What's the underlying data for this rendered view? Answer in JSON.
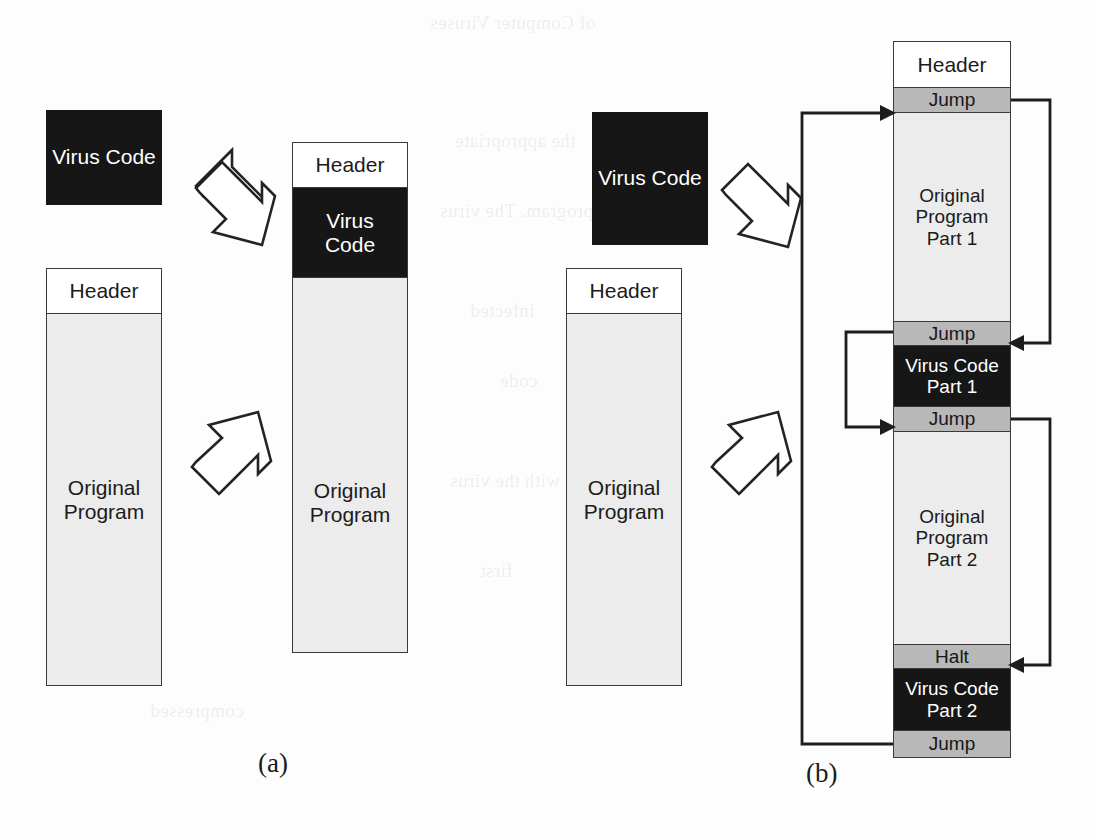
{
  "figure": {
    "captions": {
      "left": "(a)",
      "right": "(b)"
    }
  },
  "panel_a": {
    "name": "simple-prepend-infection",
    "virus_chip": {
      "line1": "Virus",
      "line2": "Code"
    },
    "original": {
      "header": "Header",
      "body_line1": "Original",
      "body_line2": "Program"
    },
    "infected": {
      "header": "Header",
      "virus_line1": "Virus",
      "virus_line2": "Code",
      "body_line1": "Original",
      "body_line2": "Program"
    },
    "arrows": [
      {
        "name": "virus-insert-arrow",
        "direction": "down-right"
      },
      {
        "name": "program-insert-arrow",
        "direction": "up-right"
      }
    ]
  },
  "panel_b": {
    "name": "split-jump-infection",
    "virus_chip": {
      "line1": "Virus",
      "line2": "Code"
    },
    "original": {
      "header": "Header",
      "body_line1": "Original",
      "body_line2": "Program"
    },
    "infected_segments": [
      {
        "id": "header",
        "kind": "white",
        "line1": "Header",
        "line2": ""
      },
      {
        "id": "jump-1",
        "kind": "gray",
        "line1": "Jump",
        "line2": ""
      },
      {
        "id": "orig-1",
        "kind": "light",
        "line1": "Original",
        "line2": "Program",
        "line3": "Part 1"
      },
      {
        "id": "jump-2",
        "kind": "gray",
        "line1": "Jump",
        "line2": ""
      },
      {
        "id": "virus-1",
        "kind": "black",
        "line1": "Virus Code",
        "line2": "Part 1"
      },
      {
        "id": "jump-3",
        "kind": "gray",
        "line1": "Jump",
        "line2": ""
      },
      {
        "id": "orig-2",
        "kind": "light",
        "line1": "Original",
        "line2": "Program",
        "line3": "Part 2"
      },
      {
        "id": "halt",
        "kind": "gray",
        "line1": "Halt",
        "line2": ""
      },
      {
        "id": "virus-2",
        "kind": "black",
        "line1": "Virus Code",
        "line2": "Part 2"
      },
      {
        "id": "jump-4",
        "kind": "gray",
        "line1": "Jump",
        "line2": ""
      }
    ],
    "flows": [
      {
        "name": "flow-bottom-jump-to-top-jump",
        "from": "jump-4",
        "to": "jump-1",
        "side": "left-outer"
      },
      {
        "name": "flow-jump1-to-jump2",
        "from": "jump-1",
        "to": "jump-2",
        "side": "right"
      },
      {
        "name": "flow-jump2-to-jump3",
        "from": "jump-2",
        "to": "jump-3",
        "side": "left-inner"
      },
      {
        "name": "flow-jump3-to-halt",
        "from": "jump-3",
        "to": "halt",
        "side": "right"
      }
    ],
    "arrows": [
      {
        "name": "virus-insert-arrow",
        "direction": "down-right"
      },
      {
        "name": "program-insert-arrow",
        "direction": "up-right"
      }
    ]
  },
  "ghost_text": {
    "lines": [
      "of Computer Viruses",
      "the appropriate",
      "program. The virus",
      "infected",
      "code",
      "with the virus",
      "first",
      "compressed"
    ]
  },
  "colors": {
    "virus_black": "#161616",
    "jump_gray": "#b8b8b8",
    "program_light": "#ececec",
    "header_white": "#ffffff",
    "outline": "#3a3a3a",
    "page": "#fdfdfd"
  }
}
